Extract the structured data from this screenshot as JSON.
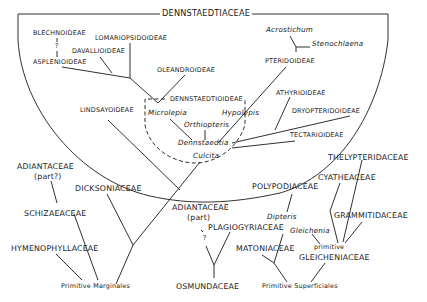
{
  "diagram": {
    "type": "phylogenetic-tree",
    "title": "DENNSTAEDTIACEAE",
    "enclosed_group": {
      "name": "DENNSTAEDTIACEAE",
      "subfamilies": [
        {
          "name": "BLECHNOIDEAE"
        },
        {
          "name": "ASPLENIOIDEAE"
        },
        {
          "name": "LOMARIOPSIDOIDEAE"
        },
        {
          "name": "DAVALLIOIDEAE"
        },
        {
          "name": "OLEANDROIDEAE"
        },
        {
          "name": "LINDSAYOIDEAE"
        },
        {
          "name": "PTERIDOIDEAE"
        },
        {
          "name": "ATHYRIOIDEAE"
        },
        {
          "name": "DRYOPTERIDOIDEAE"
        },
        {
          "name": "TECTARIOIDEAE"
        }
      ],
      "uncertain_link": "?",
      "core": {
        "name": "DENNSTAEDTIOIDEAE",
        "genera": [
          "Microlepia",
          "Hypolepis",
          "Orthiopteris",
          "Dennstaedtia",
          "Culcita"
        ]
      },
      "pteridoid_genera": [
        "Acrostichum",
        "Stenochlaena"
      ]
    },
    "families_left": [
      {
        "name": "ADIANTACEAE",
        "note": "(part?)"
      },
      {
        "name": "SCHIZAEACEAE"
      },
      {
        "name": "HYMENOPHYLLACEAE"
      },
      {
        "name": "DICKSONIACEAE"
      }
    ],
    "families_middle": [
      {
        "name": "ADIANTACEAE",
        "note": "(part)"
      },
      {
        "name": "PLAGIOGYRIACEAE"
      },
      {
        "name": "OSMUNDACEAE"
      },
      {
        "name": "POLYPODIACEAE"
      },
      {
        "name": "MATONIACEAE"
      }
    ],
    "families_right": [
      {
        "name": "THELYPTERIDACEAE"
      },
      {
        "name": "CYATHEACEAE"
      },
      {
        "name": "GRAMMITIDACEAE"
      }
    ],
    "genera_right": [
      "Dipteris",
      "Gleichenia"
    ],
    "gleichenia_group": {
      "line1": "primitive",
      "line2": "GLEICHENIACEAE"
    },
    "question_marks": [
      "?",
      "?"
    ],
    "roots": [
      "Primitive Marginales",
      "Primitive Superficiales"
    ]
  }
}
